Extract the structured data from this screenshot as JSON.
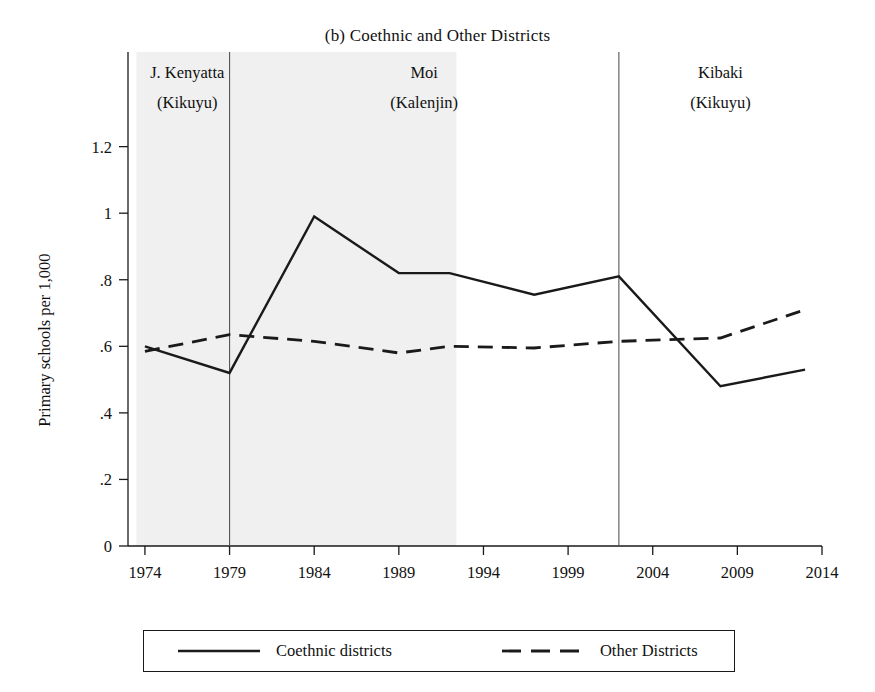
{
  "chart_data": {
    "type": "line",
    "title": "(b) Coethnic and Other Districts",
    "xlabel": "",
    "ylabel": "Primary schools per 1,000",
    "xlim": [
      1973,
      2014
    ],
    "ylim": [
      0,
      1.28
    ],
    "grid": false,
    "legend_position": "bottom-outside",
    "xticks": [
      1974,
      1979,
      1984,
      1989,
      1994,
      1999,
      2004,
      2009,
      2014
    ],
    "xtick_labels": [
      "1974",
      "1979",
      "1984",
      "1989",
      "1994",
      "1999",
      "2004",
      "2009",
      "2014"
    ],
    "yticks": [
      0,
      0.2,
      0.4,
      0.6,
      0.8,
      1,
      1.2
    ],
    "ytick_labels": [
      "0",
      ".2",
      ".4",
      ".6",
      ".8",
      "1",
      "1.2"
    ],
    "series": [
      {
        "name": "Coethnic districts",
        "style": "solid",
        "color": "#1a1a1a",
        "x": [
          1974,
          1979,
          1984,
          1989,
          1992,
          1997,
          2002,
          2008,
          2013
        ],
        "values": [
          0.6,
          0.52,
          0.99,
          0.82,
          0.82,
          0.755,
          0.81,
          0.48,
          0.53
        ]
      },
      {
        "name": "Other Districts",
        "style": "dashed",
        "color": "#1a1a1a",
        "x": [
          1974,
          1979,
          1984,
          1989,
          1992,
          1997,
          2002,
          2008,
          2013
        ],
        "values": [
          0.585,
          0.635,
          0.615,
          0.58,
          0.6,
          0.595,
          0.615,
          0.625,
          0.71
        ]
      }
    ],
    "shaded_regions": [
      {
        "x_start": 1973.5,
        "x_end": 1992.4,
        "color": "#f0f0f0",
        "label": "Moi / Kenyatta era shading"
      }
    ],
    "vertical_lines": [
      1979,
      2002
    ],
    "annotations": [
      {
        "x": 1976.5,
        "lines": [
          "J. Kenyatta",
          "(Kikuyu)"
        ]
      },
      {
        "x": 1990.5,
        "lines": [
          "Moi",
          "(Kalenjin)"
        ]
      },
      {
        "x": 2008.0,
        "lines": [
          "Kibaki",
          "(Kikuyu)"
        ]
      }
    ]
  },
  "legend": {
    "entries": [
      {
        "label": "Coethnic districts",
        "style": "solid"
      },
      {
        "label": "Other Districts",
        "style": "dashed"
      }
    ]
  }
}
